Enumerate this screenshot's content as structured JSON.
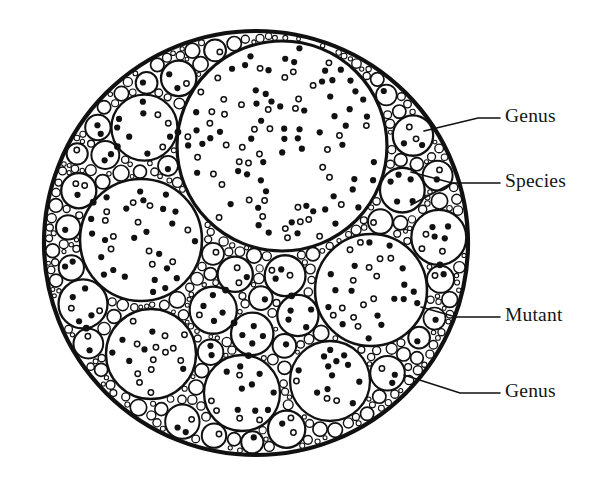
{
  "figure": {
    "background_color": "#ffffff",
    "ink_color": "#111111",
    "canvas": {
      "width": 601,
      "height": 496
    }
  },
  "outer_circle": {
    "name": "outer-genus-circle",
    "center_x": 256,
    "center_y": 243,
    "radius": 212,
    "stroke_width": 4.2
  },
  "labels": [
    {
      "text": "Genus",
      "x": 505,
      "y": 118,
      "leader": "M424,131 L478,118 L500,118"
    },
    {
      "text": "Species",
      "x": 505,
      "y": 183,
      "leader": "M411,172 L452,183 L500,183 M411,205 L452,183"
    },
    {
      "text": "Mutant",
      "x": 505,
      "y": 317,
      "leader": "M421,307 L456,317 L500,317"
    },
    {
      "text": "Genus",
      "x": 505,
      "y": 393,
      "leader": "M404,375 L460,393 L500,393"
    }
  ],
  "legend_terms": {
    "genus_label": "Genus",
    "species_label": "Species",
    "mutant_label": "Mutant"
  },
  "dot_styles": {
    "filled_label": "mutant-filled-dot",
    "hollow_label": "mutant-hollow-dot",
    "filled_radius": 3.1,
    "hollow_radius": 2.7,
    "hollow_stroke": 1.5
  },
  "packing": {
    "description": "Apollonian-style packing: one dominant upper circle, a ring of medium circles, and progressively smaller circles filling every gap out to the rim.",
    "level_counts": {
      "large": 1,
      "medium": 14,
      "small": 46,
      "tiny": 120
    },
    "circles": [
      {
        "cx": 282,
        "cy": 146,
        "r": 105,
        "sw": 3.2,
        "dots": 74
      },
      {
        "cx": 135,
        "cy": 128,
        "r": 58,
        "sw": 2.6,
        "dots": 22
      },
      {
        "cx": 141,
        "cy": 240,
        "r": 61,
        "sw": 2.6,
        "dots": 24
      },
      {
        "cx": 268,
        "cy": 312,
        "r": 62,
        "sw": 2.8,
        "dots": 25
      },
      {
        "cx": 371,
        "cy": 290,
        "r": 56,
        "sw": 2.6,
        "dots": 22
      },
      {
        "cx": 151,
        "cy": 354,
        "r": 45,
        "sw": 2.4,
        "dots": 15
      },
      {
        "cx": 242,
        "cy": 393,
        "r": 38,
        "sw": 2.3,
        "dots": 12
      },
      {
        "cx": 330,
        "cy": 381,
        "r": 40,
        "sw": 2.3,
        "dots": 13
      },
      {
        "cx": 392,
        "cy": 371,
        "r": 26,
        "sw": 2.1,
        "dots": 8
      },
      {
        "cx": 410,
        "cy": 200,
        "r": 34,
        "sw": 2.2,
        "dots": 11
      },
      {
        "cx": 414,
        "cy": 240,
        "r": 19,
        "sw": 1.9,
        "dots": 6
      },
      {
        "cx": 213,
        "cy": 232,
        "r": 36,
        "sw": 2.3,
        "dots": 12
      },
      {
        "cx": 199,
        "cy": 289,
        "r": 30,
        "sw": 2.2,
        "dots": 10
      },
      {
        "cx": 95,
        "cy": 300,
        "r": 30,
        "sw": 2.2,
        "dots": 10
      },
      {
        "cx": 83,
        "cy": 186,
        "r": 28,
        "sw": 2.1,
        "dots": 9
      },
      {
        "cx": 196,
        "cy": 75,
        "r": 26,
        "sw": 2.1,
        "dots": 8
      }
    ]
  },
  "bleed_text": ""
}
